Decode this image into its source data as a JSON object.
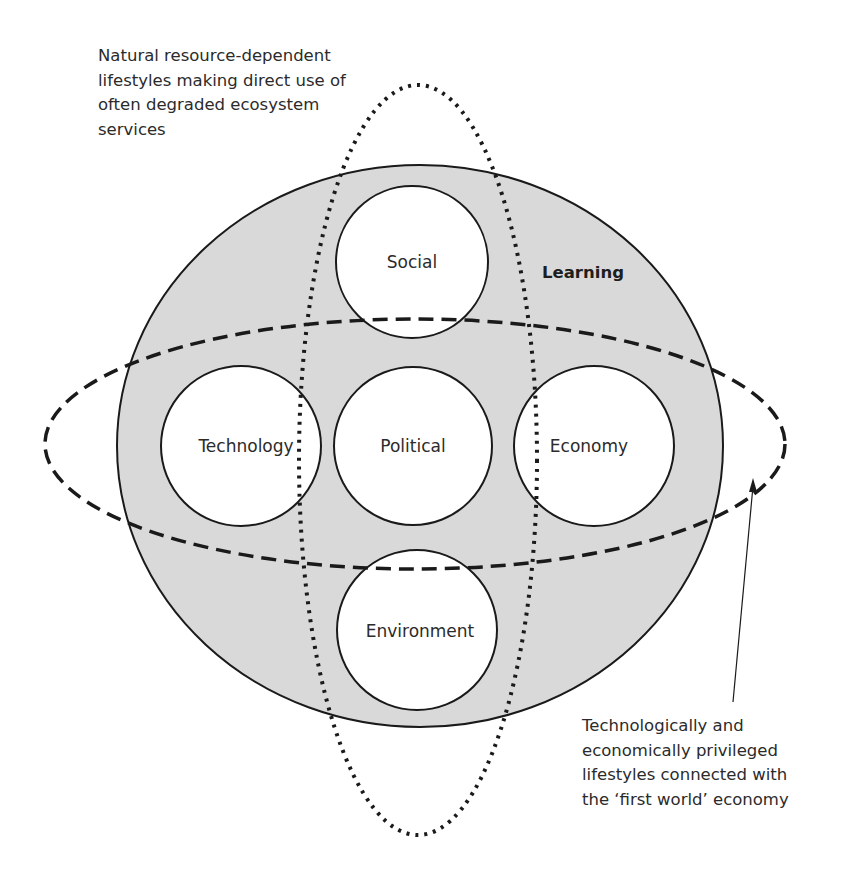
{
  "diagram": {
    "outer_label": "Learning",
    "circles": [
      {
        "id": "social",
        "label": "Social"
      },
      {
        "id": "technology",
        "label": "Technology"
      },
      {
        "id": "political",
        "label": "Political"
      },
      {
        "id": "economy",
        "label": "Economy"
      },
      {
        "id": "environment",
        "label": "Environment"
      }
    ],
    "annotations": {
      "dotted_ellipse": "Natural resource-dependent\nlifestyles making direct use of\noften degraded ecosystem\nservices",
      "dashed_ellipse": "Technologically and\neconomically privileged\nlifestyles connected with\nthe ‘first world’ economy"
    },
    "colors": {
      "outer_fill": "#d9d9d9",
      "stroke": "#1a1a1a",
      "inner_fill": "#ffffff"
    }
  }
}
